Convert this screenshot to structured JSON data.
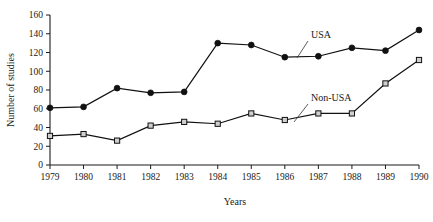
{
  "chart_data": {
    "type": "line",
    "title": "",
    "xlabel": "Years",
    "ylabel": "Number of studies",
    "categories": [
      "1979",
      "1980",
      "1981",
      "1982",
      "1983",
      "1984",
      "1985",
      "1986",
      "1987",
      "1988",
      "1989",
      "1990"
    ],
    "x": [
      1979,
      1980,
      1981,
      1982,
      1983,
      1984,
      1985,
      1986,
      1987,
      1988,
      1989,
      1990
    ],
    "xlim": [
      1979,
      1990
    ],
    "ylim": [
      0,
      160
    ],
    "yticks": [
      0,
      20,
      40,
      60,
      80,
      100,
      120,
      140,
      160
    ],
    "ytick_labels": [
      "0",
      "20",
      "40",
      "60",
      "80",
      "100",
      "120",
      "140",
      "160"
    ],
    "grid": false,
    "legend_position": "inline-annotation",
    "series": [
      {
        "name": "USA",
        "marker": "filled-circle",
        "values": [
          61,
          62,
          82,
          77,
          78,
          130,
          128,
          115,
          116,
          125,
          122,
          144
        ]
      },
      {
        "name": "Non-USA",
        "marker": "open-square",
        "values": [
          31,
          33,
          26,
          42,
          46,
          44,
          55,
          48,
          55,
          55,
          87,
          112
        ]
      }
    ],
    "annotations": [
      {
        "text": "USA",
        "series": "USA",
        "points_to_year": 1986
      },
      {
        "text": "Non-USA",
        "series": "Non-USA",
        "points_to_year": 1986
      }
    ]
  },
  "axes": {
    "y_axis_title": "Number of studies",
    "x_axis_title": "Years"
  },
  "labels": {
    "usa": "USA",
    "non_usa": "Non-USA"
  },
  "colors": {
    "ink": "#111111",
    "marker_fill_open": "#cfcfcf",
    "background": "#ffffff"
  }
}
